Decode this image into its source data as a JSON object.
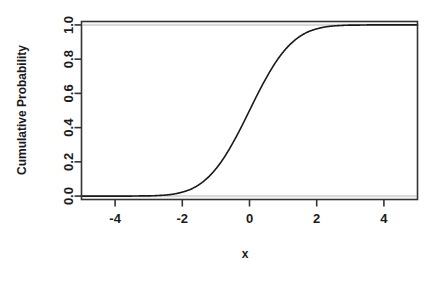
{
  "figure": {
    "cropped_title": "Standard Normal CDF",
    "background_color": "#ffffff",
    "axis_color": "#333333",
    "curve_color": "#1a1a1a",
    "gridline_color": "#d9d9d9"
  },
  "chart_data": {
    "type": "line",
    "title": "",
    "xlabel": "x",
    "ylabel": "Cumulative Probability",
    "xlim": [
      -5,
      5
    ],
    "ylim": [
      -0.02,
      1.02
    ],
    "xticks": [
      -4,
      -2,
      0,
      2,
      4
    ],
    "xtick_labels": [
      "-4",
      "-2",
      "0",
      "2",
      "4"
    ],
    "yticks": [
      0.0,
      0.2,
      0.4,
      0.6,
      0.8,
      1.0
    ],
    "ytick_labels": [
      "0.0",
      "0.2",
      "0.4",
      "0.6",
      "0.8",
      "1.0"
    ],
    "grid": false,
    "legend": null,
    "reference_lines": [
      {
        "axis": "y",
        "value": 1.0,
        "color": "#d9d9d9"
      },
      {
        "axis": "y",
        "value": 0.0,
        "color": "#d9d9d9"
      }
    ],
    "series": [
      {
        "name": "Cumulative Probability",
        "x": [
          -5.0,
          -4.75,
          -4.5,
          -4.25,
          -4.0,
          -3.75,
          -3.5,
          -3.25,
          -3.0,
          -2.75,
          -2.5,
          -2.25,
          -2.0,
          -1.75,
          -1.5,
          -1.25,
          -1.0,
          -0.75,
          -0.5,
          -0.25,
          0.0,
          0.25,
          0.5,
          0.75,
          1.0,
          1.25,
          1.5,
          1.75,
          2.0,
          2.25,
          2.5,
          2.75,
          3.0,
          3.25,
          3.5,
          3.75,
          4.0,
          4.25,
          4.5,
          4.75,
          5.0
        ],
        "y": [
          0.0,
          0.0,
          0.0,
          0.0,
          0.0,
          0.0,
          0.0,
          0.001,
          0.001,
          0.003,
          0.006,
          0.012,
          0.023,
          0.04,
          0.067,
          0.106,
          0.159,
          0.227,
          0.309,
          0.401,
          0.5,
          0.599,
          0.691,
          0.773,
          0.841,
          0.894,
          0.933,
          0.96,
          0.977,
          0.988,
          0.994,
          0.997,
          0.999,
          0.999,
          1.0,
          1.0,
          1.0,
          1.0,
          1.0,
          1.0,
          1.0
        ]
      }
    ]
  }
}
